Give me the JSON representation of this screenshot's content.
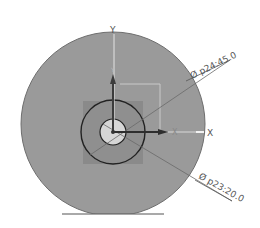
{
  "sketch": {
    "colors": {
      "background": "#ffffff",
      "body_fill": "#9a9a9a",
      "body_edge": "#555555",
      "square_fill": "#8c8c8c",
      "outer_hole_edge": "#222222",
      "inner_hole_fill": "#d6d6d6",
      "axis_dark": "#3c3c3c",
      "axis_light": "#d8d8d8",
      "dimension_line": "#666666"
    },
    "axes": {
      "y_label": "Y",
      "y_small_label": "Y",
      "x_label": "X",
      "x_small_label": "X"
    },
    "dimensions": [
      {
        "symbol": "Ø",
        "name": "p24",
        "value": "45.0",
        "text": "Ø p24:45.0"
      },
      {
        "symbol": "Ø",
        "name": "p23",
        "value": "20.0",
        "text": "Ø p23:20.0"
      }
    ]
  }
}
